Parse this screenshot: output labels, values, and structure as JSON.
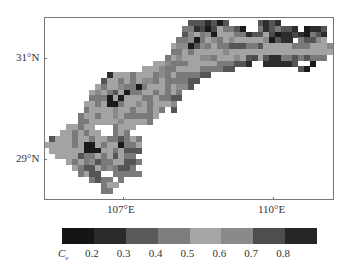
{
  "map": {
    "x_ticks": [
      {
        "label": "107°E",
        "x": 123
      },
      {
        "label": "110°E",
        "x": 273
      }
    ],
    "y_ticks": [
      {
        "label": "31°N",
        "y": 58
      },
      {
        "label": "29°N",
        "y": 159
      }
    ],
    "cell_size": 5.8,
    "palette": [
      "#1a1a1a",
      "#2d2d2d",
      "#555555",
      "#7a7a7a",
      "#a3a3a3",
      "#8a8a8a",
      "#4a4a4a",
      "#222222"
    ],
    "grid_origin": {
      "col0": 0,
      "row0": 0
    },
    "grid_rows": [
      ".........................2221202.....2121..........",
      "........................33160643320..3123221.0112...",
      "........................2543504443312246011610321...",
      ".......................33503453454444450211.32254...",
      "......................4550253433222332444443334445..",
      "......................33434444454444444444444444444.",
      ".....................3454445534445426421133232333...",
      "...................44533344444333221..111112..0......",
      ".................4445334444333322...........20......",
      "...........144434443534333322.......................",
      "..........24434345534333322.........................",
      ".........43445330344434552..........................",
      "........4543240334434343...........................",
      "........3330404443343322...........................",
      ".......4434003445434445............................",
      ".......34444544344343.2............................",
      "......34434454333334...............................",
      "......3344444544443................................",
      "....44344...3444...................................",
      "...4434344..343....................................",
      ".2444344344332343..................................",
      "44444340043440334..................................",
      ".4444440004434222..................................",
      "..44442334342433...................................",
      "....4343523344223..................................",
      ".....43224353223...................................",
      "......3422..33333..................................",
      "........3233.3.....................................",
      "..........344......................................",
      "..........33......................................."
    ]
  },
  "colorbar": {
    "title": "C",
    "title_sub": "v",
    "colors": [
      "#151515",
      "#2a2a2a",
      "#595959",
      "#7d7d7d",
      "#a6a6a6",
      "#8a8a8a",
      "#4e4e4e",
      "#262626"
    ],
    "tick_labels": [
      "0.2",
      "0.3",
      "0.4",
      "0.5",
      "0.6",
      "0.7",
      "0.8"
    ]
  },
  "chart_data": {
    "type": "heatmap",
    "title": "",
    "xlabel": "Longitude",
    "ylabel": "Latitude",
    "x_tick_labels": [
      "107°E",
      "110°E"
    ],
    "y_tick_labels": [
      "31°N",
      "29°N"
    ],
    "colorbar_label": "Cv",
    "colorbar_ticks": [
      0.2,
      0.3,
      0.4,
      0.5,
      0.6,
      0.7,
      0.8
    ],
    "colorbar_bins": [
      "<0.2",
      "0.2-0.3",
      "0.3-0.4",
      "0.4-0.5",
      "0.5-0.6",
      "0.6-0.7",
      "0.7-0.8",
      ">0.8"
    ]
  }
}
